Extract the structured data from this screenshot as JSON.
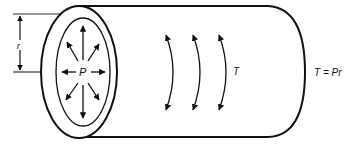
{
  "diagram": {
    "labels": {
      "radius": "r",
      "pressure": "P",
      "tension": "T",
      "equation": "T = Pr"
    },
    "colors": {
      "stroke": "#111111",
      "background": "#ffffff"
    },
    "elements": [
      "dimension-lines-radius",
      "cylinder-outer-end-ellipse",
      "cylinder-inner-end-ellipse",
      "radial-pressure-arrows-8",
      "cylinder-body-outline",
      "hoop-tension-arrows-3"
    ]
  }
}
